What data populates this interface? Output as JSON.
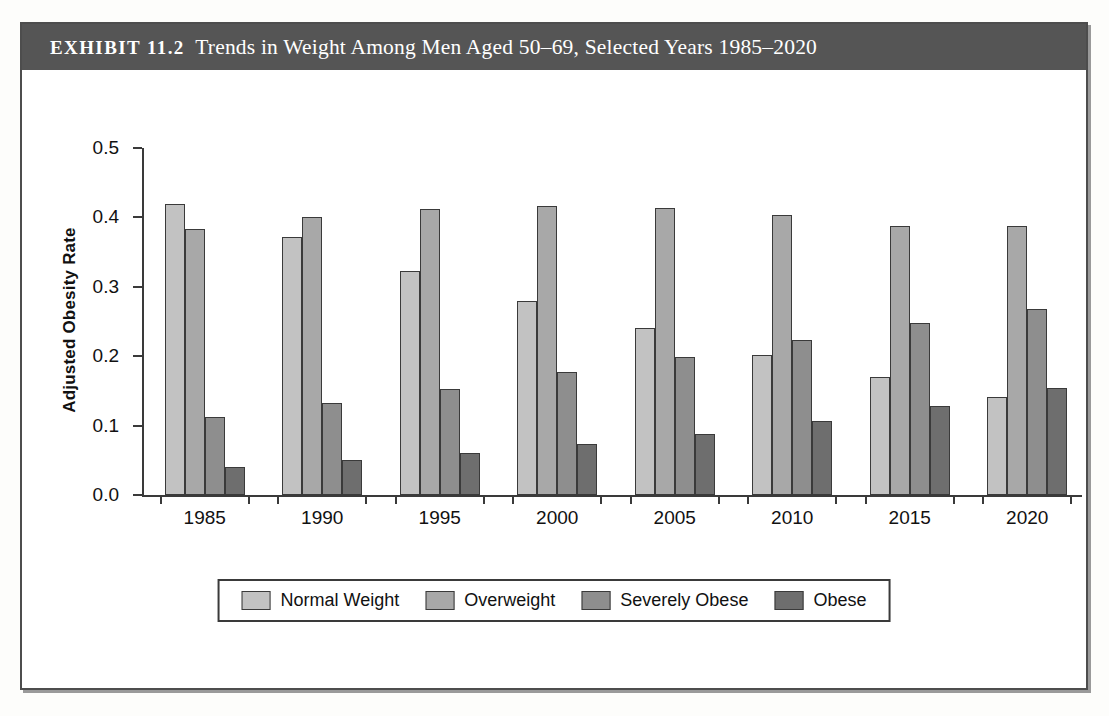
{
  "exhibit": {
    "kicker": "EXHIBIT 11.2",
    "title": "Trends in Weight Among Men Aged 50–69, Selected Years 1985–2020"
  },
  "colors": {
    "series": [
      "#c2c2c2",
      "#a8a8a8",
      "#8e8e8e",
      "#6e6e6e"
    ],
    "axis": "#3a3a3a",
    "title_bar": "#555555",
    "frame": "#4d4d4d"
  },
  "chart_data": {
    "type": "bar",
    "title": "Trends in Weight Among Men Aged 50–69, Selected Years 1985–2020",
    "xlabel": "",
    "ylabel": "Adjusted Obesity Rate",
    "ylim": [
      0.0,
      0.5
    ],
    "yticks": [
      "0.0",
      "0.1",
      "0.2",
      "0.3",
      "0.4",
      "0.5"
    ],
    "ytick_values": [
      0.0,
      0.1,
      0.2,
      0.3,
      0.4,
      0.5
    ],
    "grid": false,
    "legend_position": "bottom",
    "categories": [
      "1985",
      "1990",
      "1995",
      "2000",
      "2005",
      "2010",
      "2015",
      "2020"
    ],
    "series": [
      {
        "name": "Normal Weight",
        "color": "#c2c2c2",
        "values": [
          0.42,
          0.372,
          0.323,
          0.279,
          0.24,
          0.202,
          0.17,
          0.141
        ]
      },
      {
        "name": "Overweight",
        "color": "#a8a8a8",
        "values": [
          0.384,
          0.4,
          0.412,
          0.416,
          0.414,
          0.404,
          0.388,
          0.387
        ]
      },
      {
        "name": "Severely Obese",
        "color": "#8e8e8e",
        "values": [
          0.113,
          0.132,
          0.153,
          0.177,
          0.199,
          0.224,
          0.248,
          0.268
        ]
      },
      {
        "name": "Obese",
        "color": "#6e6e6e",
        "values": [
          0.04,
          0.05,
          0.061,
          0.074,
          0.088,
          0.107,
          0.128,
          0.154
        ]
      }
    ]
  }
}
